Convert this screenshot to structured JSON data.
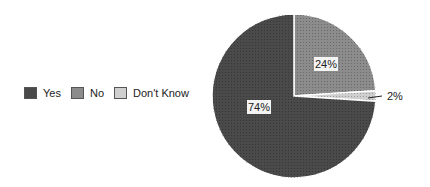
{
  "chart_data": {
    "type": "pie",
    "title": "",
    "categories": [
      "Yes",
      "No",
      "Don't Know"
    ],
    "values": [
      74,
      24,
      2
    ],
    "labels": [
      "74%",
      "24%",
      "2%"
    ],
    "colors": [
      "#4a4a4a",
      "#8c8c8c",
      "#cfcfcf"
    ],
    "legend_position": "left",
    "start_angle_deg": 0,
    "direction": "clockwise"
  },
  "legend": {
    "items": [
      {
        "label": "Yes",
        "color": "#4a4a4a"
      },
      {
        "label": "No",
        "color": "#8c8c8c"
      },
      {
        "label": "Don't Know",
        "color": "#cfcfcf"
      }
    ]
  }
}
